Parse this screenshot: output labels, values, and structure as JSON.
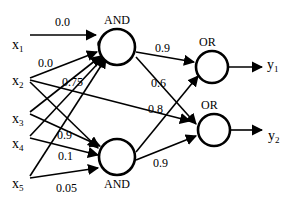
{
  "figure": {
    "type": "neural-network-diagram",
    "background_color": "#ffffff",
    "stroke_color": "#000000",
    "width": 292,
    "height": 201
  },
  "inputs": [
    {
      "id": "x1",
      "label": "x",
      "sub": "1",
      "x": 12,
      "y": 38
    },
    {
      "id": "x2",
      "label": "x",
      "sub": "2",
      "x": 12,
      "y": 74
    },
    {
      "id": "x3",
      "label": "x",
      "sub": "3",
      "x": 12,
      "y": 112
    },
    {
      "id": "x4",
      "label": "x",
      "sub": "4",
      "x": 12,
      "y": 137
    },
    {
      "id": "x5",
      "label": "x",
      "sub": "5",
      "x": 12,
      "y": 177
    }
  ],
  "outputs": [
    {
      "id": "y1",
      "label": "y",
      "sub": "1",
      "x": 267,
      "y": 58
    },
    {
      "id": "y2",
      "label": "y",
      "sub": "2",
      "x": 268,
      "y": 129
    }
  ],
  "nodes": [
    {
      "id": "and-top",
      "label": "AND",
      "label_pos": "above",
      "cx": 117,
      "cy": 47,
      "r": 18
    },
    {
      "id": "and-bottom",
      "label": "AND",
      "label_pos": "below",
      "cx": 117,
      "cy": 157,
      "r": 18
    },
    {
      "id": "or-top",
      "label": "OR",
      "label_pos": "above",
      "cx": 212,
      "cy": 67,
      "r": 16
    },
    {
      "id": "or-bottom",
      "label": "OR",
      "label_pos": "above",
      "cx": 214,
      "cy": 130,
      "r": 16
    }
  ],
  "inhibitor": {
    "name": "inhibitory-marker",
    "cx": 102,
    "cy": 44,
    "r": 4
  },
  "weights": [
    {
      "id": "w-x1-andtop",
      "value": "0.0",
      "x": 55,
      "y": 16,
      "from": "x1",
      "to": "and-top"
    },
    {
      "id": "w-x2-andtop",
      "value": "0.0",
      "x": 38,
      "y": 57,
      "from": "x2",
      "to": "and-top"
    },
    {
      "id": "w-x3-andtop",
      "value": "0.75",
      "x": 62,
      "y": 76,
      "from": "x3",
      "to": "and-top"
    },
    {
      "id": "w-x3-andbot",
      "value": "0.9",
      "x": 57,
      "y": 129,
      "from": "x3",
      "to": "and-bottom"
    },
    {
      "id": "w-x4-andbot",
      "value": "0.1",
      "x": 58,
      "y": 150,
      "from": "x4",
      "to": "and-bottom"
    },
    {
      "id": "w-x5-andbot",
      "value": "0.05",
      "x": 56,
      "y": 182,
      "from": "x5",
      "to": "and-bottom"
    },
    {
      "id": "w-andtop-ortop",
      "value": "0.9",
      "x": 155,
      "y": 42,
      "from": "and-top",
      "to": "or-top"
    },
    {
      "id": "w-andtop-orbot",
      "value": "0.6",
      "x": 151,
      "y": 77,
      "from": "and-top",
      "to": "or-bottom"
    },
    {
      "id": "w-andbot-ortop",
      "value": "0.8",
      "x": 148,
      "y": 103,
      "from": "and-bottom",
      "to": "or-bottom"
    },
    {
      "id": "w-andbot-orbot",
      "value": "0.9",
      "x": 153,
      "y": 157,
      "from": "and-bottom",
      "to": "or-bottom"
    }
  ],
  "edges": [
    {
      "id": "e-x1-andtop",
      "x1": 30,
      "y1": 35,
      "x2": 96,
      "y2": 35,
      "arrow": true
    },
    {
      "id": "e-x2-andtop",
      "x1": 30,
      "y1": 78,
      "x2": 97,
      "y2": 52,
      "arrow": true
    },
    {
      "id": "e-x2-orbot",
      "x1": 30,
      "y1": 80,
      "x2": 190,
      "y2": 121,
      "arrow": true
    },
    {
      "id": "e-x2-andbot",
      "x1": 30,
      "y1": 82,
      "x2": 98,
      "y2": 148,
      "arrow": true
    },
    {
      "id": "e-x3-andtop",
      "x1": 30,
      "y1": 112,
      "x2": 101,
      "y2": 56,
      "arrow": true
    },
    {
      "id": "e-x3-andbot",
      "x1": 30,
      "y1": 114,
      "x2": 100,
      "y2": 146,
      "arrow": true
    },
    {
      "id": "e-x4-andtop",
      "x1": 30,
      "y1": 136,
      "x2": 104,
      "y2": 57,
      "arrow": true
    },
    {
      "id": "e-x4-andbot",
      "x1": 30,
      "y1": 138,
      "x2": 98,
      "y2": 155,
      "arrow": true
    },
    {
      "id": "e-x5-andtop",
      "x1": 30,
      "y1": 176,
      "x2": 106,
      "y2": 58,
      "arrow": true
    },
    {
      "id": "e-x5-andbot",
      "x1": 30,
      "y1": 178,
      "x2": 98,
      "y2": 168,
      "arrow": true
    },
    {
      "id": "e-andtop-ortop",
      "x1": 136,
      "y1": 52,
      "x2": 194,
      "y2": 62,
      "arrow": true
    },
    {
      "id": "e-andtop-orbot",
      "x1": 136,
      "y1": 57,
      "x2": 196,
      "y2": 124,
      "arrow": true
    },
    {
      "id": "e-andbot-ortop",
      "x1": 136,
      "y1": 152,
      "x2": 198,
      "y2": 76,
      "arrow": true
    },
    {
      "id": "e-andbot-orbot",
      "x1": 136,
      "y1": 160,
      "x2": 196,
      "y2": 136,
      "arrow": true
    },
    {
      "id": "e-ortop-y1",
      "x1": 229,
      "y1": 67,
      "x2": 262,
      "y2": 67,
      "arrow": true
    },
    {
      "id": "e-orbot-y2",
      "x1": 231,
      "y1": 130,
      "x2": 262,
      "y2": 130,
      "arrow": true
    }
  ]
}
